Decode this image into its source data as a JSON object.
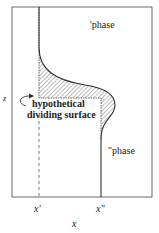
{
  "diagram": {
    "type": "interface concentration profile",
    "labels": {
      "phase_top": "'phase",
      "phase_bottom": "\"phase",
      "dividing_surface_line1": "hypothetical",
      "dividing_surface_line2": "dividing surface",
      "z_axis": "z",
      "x_axis": "x",
      "x_prime": "x'",
      "x_double_prime": "x\""
    },
    "colors": {
      "line": "#333333",
      "hatch": "#555555",
      "background": "#ffffff"
    }
  }
}
